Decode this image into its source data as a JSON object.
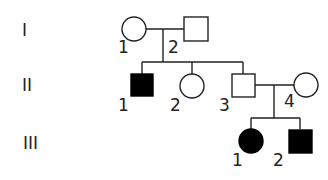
{
  "diagram": {
    "type": "pedigree",
    "generations": [
      {
        "label": "I"
      },
      {
        "label": "II"
      },
      {
        "label": "III"
      }
    ],
    "individuals": {
      "I1": {
        "number": "1",
        "sex": "female",
        "affected": false
      },
      "I2": {
        "number": "2",
        "sex": "male",
        "affected": false
      },
      "II1": {
        "number": "1",
        "sex": "male",
        "affected": true
      },
      "II2": {
        "number": "2",
        "sex": "female",
        "affected": false
      },
      "II3": {
        "number": "3",
        "sex": "male",
        "affected": false
      },
      "II4": {
        "number": "4",
        "sex": "female",
        "affected": false
      },
      "III1": {
        "number": "1",
        "sex": "female",
        "affected": true
      },
      "III2": {
        "number": "2",
        "sex": "male",
        "affected": true
      }
    },
    "colors": {
      "affected": "#000000",
      "unaffected": "#ffffff",
      "line": "#222222"
    }
  }
}
